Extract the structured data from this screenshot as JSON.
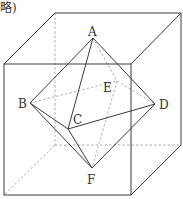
{
  "caption": "略)",
  "colors": {
    "line": "#3a3a3a",
    "hidden": "#9a9a9a",
    "label": "#333333"
  },
  "cube": {
    "front_face": [
      [
        4,
        64
      ],
      [
        131,
        64
      ],
      [
        131,
        195
      ],
      [
        4,
        195
      ]
    ],
    "back_face": [
      [
        55,
        13
      ],
      [
        181,
        13
      ],
      [
        181,
        145
      ],
      [
        55,
        145
      ]
    ]
  },
  "points": {
    "A": {
      "label": "A",
      "x": 93,
      "y": 38
    },
    "B": {
      "label": "B",
      "x": 30,
      "y": 103
    },
    "C": {
      "label": "C",
      "x": 68,
      "y": 129
    },
    "D": {
      "label": "D",
      "x": 155,
      "y": 104
    },
    "E": {
      "label": "E",
      "x": 117,
      "y": 81
    },
    "F": {
      "label": "F",
      "x": 92,
      "y": 168
    }
  },
  "labels": {
    "A": "A",
    "B": "B",
    "C": "C",
    "D": "D",
    "E": "E",
    "F": "F"
  },
  "solid_edges": [
    [
      "A",
      "B"
    ],
    [
      "A",
      "C"
    ],
    [
      "A",
      "D"
    ],
    [
      "B",
      "C"
    ],
    [
      "C",
      "D"
    ],
    [
      "B",
      "F"
    ],
    [
      "C",
      "F"
    ],
    [
      "D",
      "F"
    ]
  ],
  "hidden_edges": [
    [
      "A",
      "E"
    ],
    [
      "B",
      "E"
    ],
    [
      "E",
      "D"
    ],
    [
      "E",
      "F"
    ]
  ]
}
